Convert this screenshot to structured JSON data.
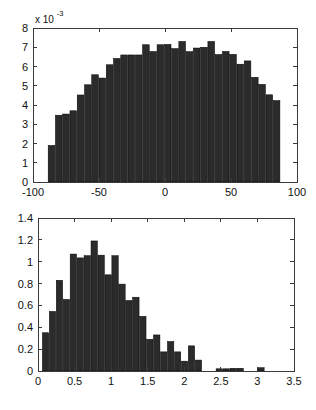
{
  "figure": {
    "background_color": "#ffffff",
    "bar_color": "#2b2b2b",
    "axis_color": "#3a3a3a"
  },
  "chart_data": [
    {
      "type": "bar",
      "id": "top-histogram",
      "title": "",
      "subtitle": "",
      "xlabel": "",
      "ylabel": "",
      "exponent_label": "x 10",
      "exponent_power": "-3",
      "y_scale_factor": 0.001,
      "grid": false,
      "legend": null,
      "xlim": [
        -100,
        100
      ],
      "ylim": [
        0,
        8
      ],
      "xticks": [
        -100,
        -50,
        0,
        50,
        100
      ],
      "xticklabels": [
        "-100",
        "-50",
        "0",
        "50",
        "100"
      ],
      "yticks": [
        0,
        1,
        2,
        3,
        4,
        5,
        6,
        7,
        8
      ],
      "yticklabels": [
        "0",
        "1",
        "2",
        "3",
        "4",
        "5",
        "6",
        "7",
        "8"
      ],
      "bin_edges": [
        -88.5,
        -83.0,
        -77.5,
        -72.0,
        -66.5,
        -61.0,
        -55.5,
        -50.0,
        -44.5,
        -39.0,
        -33.5,
        -28.0,
        -22.5,
        -17.0,
        -11.5,
        -6.0,
        -0.5,
        5.0,
        10.5,
        16.0,
        21.5,
        27.0,
        32.5,
        38.0,
        43.5,
        49.0,
        54.5,
        60.0,
        65.5,
        71.0,
        76.5,
        82.0,
        87.5
      ],
      "categories": [
        -85.75,
        -80.25,
        -74.75,
        -69.25,
        -63.75,
        -58.25,
        -52.75,
        -47.25,
        -41.75,
        -36.25,
        -30.75,
        -25.25,
        -19.75,
        -14.25,
        -8.75,
        -3.25,
        2.25,
        7.75,
        13.25,
        18.75,
        24.25,
        29.75,
        35.25,
        40.75,
        46.25,
        51.75,
        57.25,
        62.75,
        68.25,
        73.75,
        79.25,
        84.75
      ],
      "values": [
        1.9,
        3.47,
        3.53,
        3.7,
        4.52,
        5.05,
        5.57,
        5.4,
        6.09,
        6.42,
        6.6,
        6.6,
        6.6,
        7.13,
        6.78,
        7.13,
        7.15,
        6.93,
        7.3,
        6.77,
        6.96,
        7.0,
        7.3,
        6.62,
        6.78,
        6.63,
        6.12,
        6.29,
        5.44,
        5.07,
        4.53,
        4.23,
        3.17,
        1.93
      ]
    },
    {
      "type": "bar",
      "id": "bottom-histogram",
      "title": "",
      "subtitle": "",
      "xlabel": "",
      "ylabel": "",
      "exponent_label": "",
      "exponent_power": "",
      "y_scale_factor": 1,
      "grid": false,
      "legend": null,
      "xlim": [
        0,
        3.5
      ],
      "ylim": [
        0,
        1.4
      ],
      "xticks": [
        0,
        0.5,
        1,
        1.5,
        2,
        2.5,
        3,
        3.5
      ],
      "xticklabels": [
        "0",
        "0.5",
        "1",
        "1.5",
        "2",
        "2.5",
        "3",
        "3.5"
      ],
      "yticks": [
        0,
        0.2,
        0.4,
        0.6,
        0.8,
        1,
        1.2,
        1.4
      ],
      "yticklabels": [
        "0",
        "0.2",
        "0.4",
        "0.6",
        "0.8",
        "1",
        "1.2",
        "1.4"
      ],
      "bin_edges": [
        0.06,
        0.155,
        0.25,
        0.345,
        0.44,
        0.535,
        0.63,
        0.725,
        0.82,
        0.915,
        1.01,
        1.105,
        1.2,
        1.295,
        1.39,
        1.485,
        1.58,
        1.675,
        1.77,
        1.865,
        1.96,
        2.055,
        2.15,
        2.245,
        2.34,
        2.435,
        2.53,
        2.625,
        2.72,
        2.815,
        2.91,
        3.005,
        3.1,
        3.195,
        3.29
      ],
      "categories": [
        0.1075,
        0.2025,
        0.2975,
        0.3925,
        0.4875,
        0.5825,
        0.6775,
        0.7725,
        0.8675,
        0.9625,
        1.0575,
        1.1525,
        1.2475,
        1.3425,
        1.4375,
        1.5325,
        1.6275,
        1.7225,
        1.8175,
        1.9125,
        2.0075,
        2.1025,
        2.1975,
        2.2925,
        2.3875,
        2.4825,
        2.5775,
        2.6725,
        2.7675,
        2.8625,
        2.9575,
        3.0525,
        3.1475,
        3.2425
      ],
      "values": [
        0.35,
        0.545,
        0.83,
        0.655,
        1.07,
        1.035,
        1.055,
        1.19,
        1.06,
        0.88,
        1.055,
        0.795,
        0.645,
        0.675,
        0.5,
        0.29,
        0.33,
        0.175,
        0.27,
        0.175,
        0.09,
        0.23,
        0.1,
        0.0,
        0.0,
        0.02,
        0.02,
        0.025,
        0.025,
        0.0,
        0.0,
        0.03,
        0.0
      ]
    }
  ]
}
